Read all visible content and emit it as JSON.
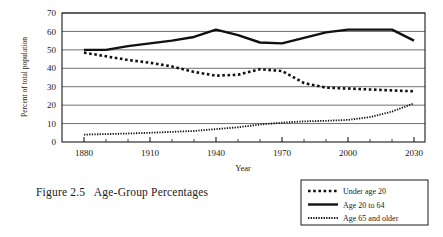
{
  "figure": {
    "caption": "Figure 2.5   Age-Group Percentages"
  },
  "chart_data": {
    "type": "line",
    "title": "",
    "xlabel": "Year",
    "ylabel": "Percent of total population",
    "xlim": [
      1870,
      2035
    ],
    "ylim": [
      0,
      70
    ],
    "xticks": [
      1880,
      1910,
      1940,
      1970,
      2000,
      2030
    ],
    "xtick_labels": [
      "1880",
      "1910",
      "1940",
      "1970",
      "2000",
      "2030"
    ],
    "x_minor_tick_step": 10,
    "yticks": [
      0,
      10,
      20,
      30,
      40,
      50,
      60,
      70
    ],
    "ytick_labels": [
      "0",
      "10",
      "20",
      "30",
      "40",
      "50",
      "60",
      "70"
    ],
    "grid": "horizontal",
    "legend_position": "below-right",
    "x": [
      1880,
      1890,
      1900,
      1910,
      1920,
      1930,
      1940,
      1950,
      1960,
      1970,
      1980,
      1990,
      2000,
      2010,
      2020,
      2030
    ],
    "series": [
      {
        "name": "Under age 20",
        "style": "dotted-heavy",
        "color": "#111111",
        "values": [
          48.5,
          46.5,
          44.5,
          43.0,
          41.0,
          38.0,
          36.0,
          36.5,
          39.5,
          38.5,
          32.0,
          29.5,
          29.0,
          28.5,
          28.0,
          27.5
        ]
      },
      {
        "name": "Age 20 to 64",
        "style": "solid",
        "color": "#111111",
        "values": [
          50.0,
          50.0,
          52.0,
          53.5,
          55.0,
          57.0,
          61.0,
          58.0,
          54.0,
          53.5,
          56.5,
          59.5,
          61.0,
          61.0,
          61.0,
          55.0
        ]
      },
      {
        "name": "Age 65 and older",
        "style": "dotted-fine",
        "color": "#111111",
        "values": [
          4.0,
          4.3,
          4.6,
          5.0,
          5.5,
          6.0,
          7.0,
          8.0,
          9.5,
          10.5,
          11.2,
          11.5,
          12.0,
          13.5,
          16.5,
          21.0
        ]
      }
    ],
    "legend": [
      {
        "label": "Under age 20",
        "style": "dotted-heavy"
      },
      {
        "label": "Age 20 to 64",
        "style": "solid"
      },
      {
        "label": "Age 65 and older",
        "style": "dotted-fine"
      }
    ]
  }
}
